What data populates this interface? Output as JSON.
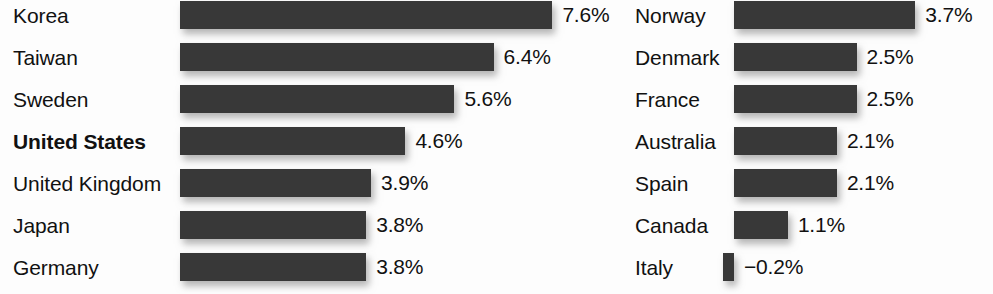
{
  "chart_data": {
    "type": "bar",
    "orientation": "horizontal",
    "title": "",
    "subtitle": "",
    "xlabel": "",
    "ylabel": "",
    "value_suffix": "%",
    "grid": false,
    "legend": false,
    "axis_visible": false,
    "value_labels_shown": true,
    "xlim": [
      -0.2,
      7.6
    ],
    "px_per_unit": 49,
    "bar_color": "#383838",
    "text_color": "#111111",
    "background_color": "#ffffff",
    "highlighted_category": "United States",
    "categories": [
      "Korea",
      "Taiwan",
      "Sweden",
      "United States",
      "United Kingdom",
      "Japan",
      "Germany",
      "Norway",
      "Denmark",
      "France",
      "Australia",
      "Spain",
      "Canada",
      "Italy"
    ],
    "values": [
      7.6,
      6.4,
      5.6,
      4.6,
      3.9,
      3.8,
      3.8,
      3.7,
      2.5,
      2.5,
      2.1,
      2.1,
      1.1,
      -0.2
    ],
    "panels": [
      {
        "name": "left-column",
        "rows": [
          {
            "label": "Korea",
            "value": 7.6,
            "value_label": "7.6%",
            "bold": false
          },
          {
            "label": "Taiwan",
            "value": 6.4,
            "value_label": "6.4%",
            "bold": false
          },
          {
            "label": "Sweden",
            "value": 5.6,
            "value_label": "5.6%",
            "bold": false
          },
          {
            "label": "United States",
            "value": 4.6,
            "value_label": "4.6%",
            "bold": true
          },
          {
            "label": "United Kingdom",
            "value": 3.9,
            "value_label": "3.9%",
            "bold": false
          },
          {
            "label": "Japan",
            "value": 3.8,
            "value_label": "3.8%",
            "bold": false
          },
          {
            "label": "Germany",
            "value": 3.8,
            "value_label": "3.8%",
            "bold": false
          }
        ]
      },
      {
        "name": "right-column",
        "rows": [
          {
            "label": "Norway",
            "value": 3.7,
            "value_label": "3.7%",
            "bold": false
          },
          {
            "label": "Denmark",
            "value": 2.5,
            "value_label": "2.5%",
            "bold": false
          },
          {
            "label": "France",
            "value": 2.5,
            "value_label": "2.5%",
            "bold": false
          },
          {
            "label": "Australia",
            "value": 2.1,
            "value_label": "2.1%",
            "bold": false
          },
          {
            "label": "Spain",
            "value": 2.1,
            "value_label": "2.1%",
            "bold": false
          },
          {
            "label": "Canada",
            "value": 1.1,
            "value_label": "1.1%",
            "bold": false
          },
          {
            "label": "Italy",
            "value": -0.2,
            "value_label": "−0.2%",
            "bold": false
          }
        ]
      }
    ]
  }
}
